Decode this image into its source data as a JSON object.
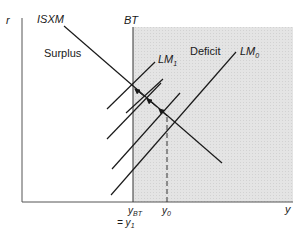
{
  "diagram": {
    "axes": {
      "y_label": "r",
      "x_label": "y"
    },
    "curves": {
      "isxm": "ISXM",
      "bt": "BT",
      "lm0": "LM",
      "lm0_sub": "0",
      "lm1": "LM",
      "lm1_sub": "1"
    },
    "regions": {
      "surplus": "Surplus",
      "deficit": "Deficit"
    },
    "x_ticks": {
      "ybt": "y",
      "ybt_sub": "BT",
      "y0": "y",
      "y0_sub": "0",
      "eq": "= y",
      "eq_sub": "1"
    },
    "colors": {
      "shade": "#e0e0e0",
      "line": "#1a1a1a",
      "axis": "#555555"
    }
  }
}
